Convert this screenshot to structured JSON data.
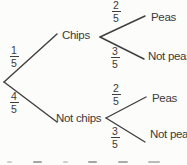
{
  "diagram_type": "probability-tree",
  "tree": {
    "stage1": [
      {
        "label": "Chips",
        "prob_num": "1",
        "prob_den": "5"
      },
      {
        "label": "Not chips",
        "prob_num": "4",
        "prob_den": "5"
      }
    ],
    "stage2": [
      {
        "parent": "Chips",
        "label": "Peas",
        "prob_num": "2",
        "prob_den": "5"
      },
      {
        "parent": "Chips",
        "label": "Not peas",
        "prob_num": "3",
        "prob_den": "5"
      },
      {
        "parent": "Not chips",
        "label": "Peas",
        "prob_num": "2",
        "prob_den": "5"
      },
      {
        "parent": "Not chips",
        "label": "Not peas",
        "prob_num": "3",
        "prob_den": "5"
      }
    ]
  },
  "colors": {
    "ink": "#3d3d3d",
    "line": "#3f3f3f",
    "background": "#fcfcfa"
  }
}
